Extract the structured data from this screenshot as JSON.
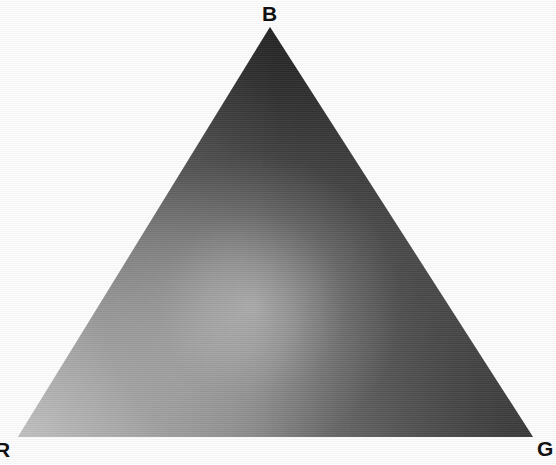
{
  "figure": {
    "title": "",
    "background_color": "#fefefe"
  },
  "chart_data": {
    "type": "scatter",
    "title": "",
    "subtitle": "",
    "xlabel": "",
    "ylabel": "",
    "shape": "triangle",
    "grid": false,
    "legend_position": "none",
    "annotations": [],
    "vertices": [
      {
        "name": "B",
        "label": "B",
        "role": "blue-primary",
        "position": {
          "x": 270,
          "y": 27
        },
        "label_position": {
          "x": 270,
          "y": 14
        },
        "luminance": 58,
        "color": "#3a3a3a",
        "clipped": false
      },
      {
        "name": "R",
        "label": "R",
        "role": "red-primary",
        "position": {
          "x": 18,
          "y": 437
        },
        "label_position": {
          "x": 4,
          "y": 450
        },
        "luminance": 128,
        "color": "#808080",
        "clipped": true
      },
      {
        "name": "G",
        "label": "G",
        "role": "green-primary",
        "position": {
          "x": 533,
          "y": 437
        },
        "label_position": {
          "x": 545,
          "y": 449
        },
        "luminance": 60,
        "color": "#3c3c3c",
        "clipped": false
      }
    ],
    "hotspot": {
      "label": "white-point",
      "position": {
        "x": 252,
        "y": 306
      },
      "luminance": 154,
      "color": "#9a9a9a",
      "radius": 118
    },
    "sample_points": [
      {
        "x": 270,
        "y": 60,
        "luminance": 60,
        "color": "#3c3c3c"
      },
      {
        "x": 165,
        "y": 200,
        "luminance": 85,
        "color": "#555555"
      },
      {
        "x": 345,
        "y": 215,
        "luminance": 74,
        "color": "#4a4a4a"
      },
      {
        "x": 140,
        "y": 320,
        "luminance": 111,
        "color": "#6f6f6f"
      },
      {
        "x": 252,
        "y": 306,
        "luminance": 154,
        "color": "#9a9a9a"
      },
      {
        "x": 405,
        "y": 320,
        "luminance": 74,
        "color": "#4a4a4a"
      },
      {
        "x": 60,
        "y": 420,
        "luminance": 124,
        "color": "#7c7c7c"
      },
      {
        "x": 280,
        "y": 410,
        "luminance": 132,
        "color": "#848484"
      },
      {
        "x": 480,
        "y": 420,
        "luminance": 68,
        "color": "#444444"
      }
    ],
    "colorbar": null,
    "xlim": [
      0,
      556
    ],
    "ylim": [
      0,
      465
    ]
  },
  "labels": {
    "b": "B",
    "r": "R",
    "g": "G"
  },
  "colors": {
    "background": "#fefefe",
    "label_text": "#111111",
    "vertex_b": "#3a3a3a",
    "vertex_r": "#808080",
    "vertex_g": "#3c3c3c",
    "hotspot": "#9a9a9a"
  }
}
